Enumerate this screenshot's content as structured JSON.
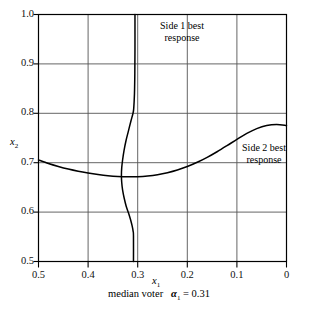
{
  "chart_data": {
    "type": "line",
    "title": "",
    "xlabel": "x1",
    "ylabel": "x2",
    "xlim": [
      0.5,
      0.0
    ],
    "ylim": [
      0.5,
      1.0
    ],
    "x_axis_reversed": true,
    "grid": true,
    "legend_position": "inline-annotations",
    "xticks": [
      "0.5",
      "0.4",
      "0.3",
      "0.2",
      "0.1",
      "0"
    ],
    "xtick_values": [
      0.5,
      0.4,
      0.3,
      0.2,
      0.1,
      0.0
    ],
    "yticks": [
      "0.5",
      "0.6",
      "0.7",
      "0.8",
      "0.9",
      "1.0"
    ],
    "ytick_values": [
      0.5,
      0.6,
      0.7,
      0.8,
      0.9,
      1.0
    ],
    "caption": "median voter   α₁ = 0.31",
    "caption_text": "median voter",
    "caption_symbol": "α",
    "caption_sub": "1",
    "caption_eq": "= 0.31",
    "median_voter_alpha": 0.31,
    "series": [
      {
        "name": "Side 1 best response",
        "label": "Side 1 best\nresponse",
        "label_line1": "Side 1 best",
        "label_line2": "response",
        "orientation": "near-vertical",
        "points": [
          [
            0.3055,
            1.0
          ],
          [
            0.3055,
            0.93
          ],
          [
            0.3058,
            0.88
          ],
          [
            0.3065,
            0.84
          ],
          [
            0.308,
            0.81
          ],
          [
            0.3095,
            0.8
          ],
          [
            0.3135,
            0.785
          ],
          [
            0.3185,
            0.765
          ],
          [
            0.3235,
            0.745
          ],
          [
            0.3275,
            0.725
          ],
          [
            0.3305,
            0.705
          ],
          [
            0.3322,
            0.69
          ],
          [
            0.3328,
            0.675
          ],
          [
            0.3322,
            0.66
          ],
          [
            0.3305,
            0.645
          ],
          [
            0.3272,
            0.628
          ],
          [
            0.3232,
            0.612
          ],
          [
            0.3185,
            0.598
          ],
          [
            0.3145,
            0.585
          ],
          [
            0.3112,
            0.572
          ],
          [
            0.3092,
            0.561
          ],
          [
            0.3085,
            0.552
          ],
          [
            0.3085,
            0.5
          ]
        ]
      },
      {
        "name": "Side 2 best response",
        "label": "Side 2 best\nresponse",
        "label_line1": "Side 2 best",
        "label_line2": "response",
        "orientation": "u-shaped",
        "points": [
          [
            0.5,
            0.7055
          ],
          [
            0.48,
            0.6985
          ],
          [
            0.46,
            0.6925
          ],
          [
            0.44,
            0.6872
          ],
          [
            0.42,
            0.6828
          ],
          [
            0.4,
            0.6792
          ],
          [
            0.38,
            0.6762
          ],
          [
            0.36,
            0.6738
          ],
          [
            0.34,
            0.6722
          ],
          [
            0.32,
            0.6715
          ],
          [
            0.3,
            0.6718
          ],
          [
            0.28,
            0.6732
          ],
          [
            0.26,
            0.6758
          ],
          [
            0.24,
            0.6798
          ],
          [
            0.22,
            0.6852
          ],
          [
            0.2,
            0.6922
          ],
          [
            0.18,
            0.7008
          ],
          [
            0.16,
            0.7108
          ],
          [
            0.14,
            0.7222
          ],
          [
            0.12,
            0.7345
          ],
          [
            0.1,
            0.7472
          ],
          [
            0.08,
            0.7592
          ],
          [
            0.06,
            0.769
          ],
          [
            0.04,
            0.7752
          ],
          [
            0.02,
            0.7772
          ],
          [
            0.0,
            0.7755
          ]
        ]
      }
    ],
    "annotations": [
      {
        "text": "Side 1 best response",
        "x": 0.255,
        "y": 0.965
      },
      {
        "text": "Side 2 best response",
        "x": 0.065,
        "y": 0.745
      }
    ]
  },
  "colors": {
    "axis": "#000000",
    "grid": "#555555",
    "curve": "#000000",
    "background": "#ffffff"
  }
}
